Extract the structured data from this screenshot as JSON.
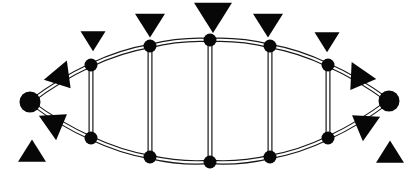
{
  "figure": {
    "background_color": "#ffffff",
    "ink_color": "#080808",
    "edge_style": "double-line",
    "width": 419,
    "height": 177
  },
  "chart_data": {
    "type": "scatter",
    "xlabel": "",
    "ylabel": "",
    "xlim": [
      0,
      419
    ],
    "ylim": [
      0,
      177
    ],
    "grid": false,
    "legend": "none",
    "nodes": [
      {
        "id": "apex-left",
        "label": "apex-left",
        "x": 30,
        "y": 102,
        "r": 10.5,
        "shape": "circle"
      },
      {
        "id": "apex-right",
        "label": "apex-right",
        "x": 389,
        "y": 101,
        "r": 10.5,
        "shape": "circle"
      },
      {
        "id": "top-1",
        "label": "top-1",
        "x": 91,
        "y": 65,
        "r": 6.5,
        "shape": "circle"
      },
      {
        "id": "top-2",
        "label": "top-2",
        "x": 150,
        "y": 46,
        "r": 6.5,
        "shape": "circle"
      },
      {
        "id": "top-3",
        "label": "top-3",
        "x": 210,
        "y": 40,
        "r": 6.5,
        "shape": "circle"
      },
      {
        "id": "top-4",
        "label": "top-4",
        "x": 270,
        "y": 46,
        "r": 6.5,
        "shape": "circle"
      },
      {
        "id": "top-5",
        "label": "top-5",
        "x": 328,
        "y": 65,
        "r": 6.5,
        "shape": "circle"
      },
      {
        "id": "bot-1",
        "label": "bot-1",
        "x": 91,
        "y": 138,
        "r": 6.5,
        "shape": "circle"
      },
      {
        "id": "bot-2",
        "label": "bot-2",
        "x": 150,
        "y": 157,
        "r": 6.5,
        "shape": "circle"
      },
      {
        "id": "bot-3",
        "label": "bot-3",
        "x": 210,
        "y": 162,
        "r": 6.5,
        "shape": "circle"
      },
      {
        "id": "bot-4",
        "label": "bot-4",
        "x": 270,
        "y": 157,
        "r": 6.5,
        "shape": "circle"
      },
      {
        "id": "bot-5",
        "label": "bot-5",
        "x": 328,
        "y": 138,
        "r": 6.5,
        "shape": "circle"
      }
    ],
    "edges": [
      {
        "from": "apex-left",
        "to": "top-1",
        "kind": "arc"
      },
      {
        "from": "top-1",
        "to": "top-2",
        "kind": "arc"
      },
      {
        "from": "top-2",
        "to": "top-3",
        "kind": "arc"
      },
      {
        "from": "top-3",
        "to": "top-4",
        "kind": "arc"
      },
      {
        "from": "top-4",
        "to": "top-5",
        "kind": "arc"
      },
      {
        "from": "top-5",
        "to": "apex-right",
        "kind": "arc"
      },
      {
        "from": "apex-left",
        "to": "bot-1",
        "kind": "arc"
      },
      {
        "from": "bot-1",
        "to": "bot-2",
        "kind": "arc"
      },
      {
        "from": "bot-2",
        "to": "bot-3",
        "kind": "arc"
      },
      {
        "from": "bot-3",
        "to": "bot-4",
        "kind": "arc"
      },
      {
        "from": "bot-4",
        "to": "bot-5",
        "kind": "arc"
      },
      {
        "from": "bot-5",
        "to": "apex-right",
        "kind": "arc"
      },
      {
        "from": "top-1",
        "to": "bot-1",
        "kind": "rung"
      },
      {
        "from": "top-2",
        "to": "bot-2",
        "kind": "rung"
      },
      {
        "from": "top-3",
        "to": "bot-3",
        "kind": "rung"
      },
      {
        "from": "top-4",
        "to": "bot-4",
        "kind": "rung"
      },
      {
        "from": "top-5",
        "to": "bot-5",
        "kind": "rung"
      }
    ],
    "markers": [
      {
        "id": "tri-top-1",
        "x": 93,
        "y": 40,
        "size": 25,
        "rotation": 180,
        "shape": "triangle"
      },
      {
        "id": "tri-top-2",
        "x": 150,
        "y": 24,
        "size": 30,
        "rotation": 180,
        "shape": "triangle"
      },
      {
        "id": "tri-top-3",
        "x": 213,
        "y": 16,
        "size": 38,
        "rotation": 180,
        "shape": "triangle"
      },
      {
        "id": "tri-top-4",
        "x": 268,
        "y": 24,
        "size": 30,
        "rotation": 180,
        "shape": "triangle"
      },
      {
        "id": "tri-top-5",
        "x": 327,
        "y": 41,
        "size": 25,
        "rotation": 180,
        "shape": "triangle"
      },
      {
        "id": "tri-left-upper",
        "x": 62,
        "y": 78,
        "size": 30,
        "rotation": 140,
        "shape": "triangle"
      },
      {
        "id": "tri-left-lower",
        "x": 56,
        "y": 122,
        "size": 30,
        "rotation": 55,
        "shape": "triangle"
      },
      {
        "id": "tri-left-corner",
        "x": 32,
        "y": 152,
        "size": 28,
        "rotation": 0,
        "shape": "triangle"
      },
      {
        "id": "tri-right-upper",
        "x": 358,
        "y": 79,
        "size": 30,
        "rotation": 215,
        "shape": "triangle"
      },
      {
        "id": "tri-right-lower",
        "x": 363,
        "y": 123,
        "size": 30,
        "rotation": 305,
        "shape": "triangle"
      },
      {
        "id": "tri-right-corner",
        "x": 390,
        "y": 153,
        "size": 28,
        "rotation": 0,
        "shape": "triangle"
      }
    ]
  }
}
